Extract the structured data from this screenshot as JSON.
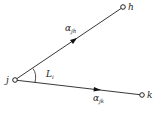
{
  "diagram": {
    "nodes": [
      {
        "id": "j",
        "label": "j",
        "x": 15,
        "y": 80
      },
      {
        "id": "h",
        "label": "h",
        "x": 123,
        "y": 7
      },
      {
        "id": "k",
        "label": "k",
        "x": 142,
        "y": 95
      }
    ],
    "edges": [
      {
        "from": "j",
        "to": "h",
        "label_main": "α",
        "label_sub": "jh"
      },
      {
        "from": "j",
        "to": "k",
        "label_main": "α",
        "label_sub": "jk"
      }
    ],
    "angle": {
      "label_main": "L",
      "label_sub": "i"
    }
  }
}
